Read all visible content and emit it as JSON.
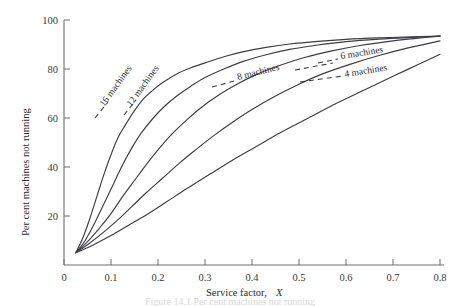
{
  "figure": {
    "caption": "Figure 14.1  Per cent machines not running",
    "background": "#ffffff",
    "ink_color": "#3c3c46",
    "axis_color": "#6f6f6f"
  },
  "chart_data": {
    "type": "line",
    "title": "",
    "xlabel": "Service factor, X",
    "xlabel_plain": "Service factor,",
    "xlabel_italic": "X",
    "ylabel": "Per cent machines not running",
    "xlim": [
      0,
      0.8
    ],
    "ylim": [
      0,
      100
    ],
    "grid": false,
    "legend_position": "inline-curve-labels",
    "xticks": [
      0,
      0.1,
      0.2,
      0.3,
      0.4,
      0.5,
      0.6,
      0.7,
      0.8
    ],
    "xticklabels": [
      "0",
      "0.1",
      "0.2",
      "0.3",
      "0.4",
      "0.5",
      "0.6",
      "0.7",
      "0.8"
    ],
    "yticks": [
      20,
      40,
      60,
      80,
      100
    ],
    "yticklabels": [
      "20",
      "40",
      "60",
      "80",
      "100"
    ],
    "series": [
      {
        "name": "16 machines",
        "label": "16 machines",
        "x": [
          0.025,
          0.04,
          0.055,
          0.07,
          0.085,
          0.1,
          0.115,
          0.13,
          0.15,
          0.17,
          0.19,
          0.21,
          0.24,
          0.27,
          0.3,
          0.34,
          0.38,
          0.43,
          0.48,
          0.54,
          0.6,
          0.67,
          0.74,
          0.8
        ],
        "y": [
          5,
          11,
          19,
          28,
          37,
          45,
          52,
          57,
          63,
          68,
          71.5,
          74.5,
          78,
          80.5,
          82.5,
          85,
          87,
          88.8,
          90.2,
          91.3,
          92.1,
          92.7,
          93.1,
          93.4
        ]
      },
      {
        "name": "12 machines",
        "label": "12 machines",
        "x": [
          0.025,
          0.045,
          0.065,
          0.085,
          0.105,
          0.125,
          0.145,
          0.165,
          0.19,
          0.215,
          0.24,
          0.27,
          0.3,
          0.34,
          0.38,
          0.43,
          0.48,
          0.54,
          0.6,
          0.67,
          0.74,
          0.8
        ],
        "y": [
          5,
          10,
          17,
          25,
          33,
          41,
          48,
          54,
          60,
          65,
          69,
          73,
          76.5,
          80,
          83,
          85.8,
          88,
          89.8,
          91.2,
          92.2,
          92.9,
          93.4
        ]
      },
      {
        "name": "8 machines",
        "label": "8 machines",
        "x": [
          0.025,
          0.05,
          0.075,
          0.1,
          0.125,
          0.15,
          0.175,
          0.2,
          0.23,
          0.26,
          0.29,
          0.33,
          0.37,
          0.41,
          0.46,
          0.51,
          0.57,
          0.63,
          0.7,
          0.75,
          0.8
        ],
        "y": [
          5,
          9.5,
          15,
          21,
          28,
          34.5,
          41,
          47,
          53.5,
          59,
          64,
          69.5,
          74,
          77.8,
          81.5,
          84.6,
          87.4,
          89.6,
          91.5,
          92.5,
          93.4
        ]
      },
      {
        "name": "6 machines",
        "label": "6 machines",
        "x": [
          0.025,
          0.055,
          0.085,
          0.115,
          0.145,
          0.175,
          0.21,
          0.245,
          0.28,
          0.32,
          0.36,
          0.4,
          0.45,
          0.5,
          0.55,
          0.61,
          0.67,
          0.73,
          0.8
        ],
        "y": [
          5,
          9,
          13.5,
          18.5,
          24,
          29.5,
          35.5,
          41.5,
          47,
          53,
          58.5,
          63.5,
          69,
          73.8,
          78,
          82,
          85.5,
          88.5,
          91.5
        ]
      },
      {
        "name": "4 machines",
        "label": "4 machines",
        "x": [
          0.025,
          0.06,
          0.1,
          0.14,
          0.18,
          0.22,
          0.26,
          0.31,
          0.36,
          0.41,
          0.46,
          0.52,
          0.58,
          0.64,
          0.7,
          0.75,
          0.8
        ],
        "y": [
          5,
          8,
          12,
          16.5,
          21,
          26,
          31,
          37,
          43,
          48.5,
          54,
          60,
          66,
          71.5,
          77,
          81.5,
          86
        ]
      }
    ],
    "annotations": [
      {
        "text": "16 machines",
        "for": "16 machines",
        "rotation": -54,
        "x_px": 104,
        "y_px": 107
      },
      {
        "text": "12 machines",
        "for": "12 machines",
        "rotation": -54,
        "x_px": 131,
        "y_px": 107
      },
      {
        "text": "8 machines",
        "for": "8 machines",
        "rotation": -14,
        "x_px": 238,
        "y_px": 78
      },
      {
        "text": "6 machines",
        "for": "6 machines",
        "rotation": -9,
        "x_px": 341,
        "y_px": 58
      },
      {
        "text": "4 machines",
        "for": "4 machines",
        "rotation": -9,
        "x_px": 345,
        "y_px": 76
      }
    ]
  }
}
